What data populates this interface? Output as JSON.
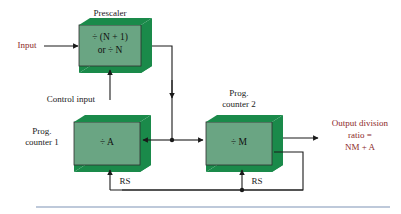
{
  "diagram": {
    "colors": {
      "block_front": "#6aa583",
      "block_side": "#1a8a4a",
      "wire": "#1a1a1a",
      "accent_text": "#8c2a2a",
      "plain_text": "#1a1a1a",
      "rule": "#7f94b5",
      "background": "#ffffff"
    },
    "blocks": [
      {
        "id": "prescaler",
        "caption": "Prescaler",
        "line1": "÷ (N + 1)",
        "line2": "or ÷ N"
      },
      {
        "id": "prog-counter-1",
        "caption_line1": "Prog.",
        "caption_line2": "counter 1",
        "body": "÷ A"
      },
      {
        "id": "prog-counter-2",
        "caption_line1": "Prog.",
        "caption_line2": "counter 2",
        "body": "÷ M"
      }
    ],
    "labels": {
      "input": "Input",
      "control_input": "Control input",
      "rs_left": "RS",
      "rs_right": "RS",
      "output_line1": "Output division",
      "output_line2": "ratio =",
      "output_line3": "NM + A"
    }
  }
}
